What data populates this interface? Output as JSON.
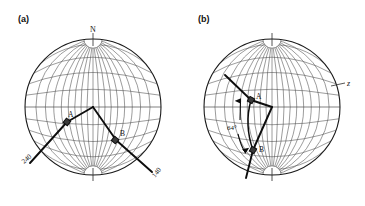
{
  "figure": {
    "type": "stereonet-pair",
    "background": "#ffffff",
    "net_line_color": "#4a4a4a",
    "rim_color": "#1a1a1a",
    "trace_color": "#0d0d0d"
  },
  "panels": [
    {
      "id": "a",
      "label": "(a)",
      "center": {
        "x": 93,
        "y": 107
      },
      "radius": 68,
      "rotation_deg": 0,
      "north_label": "N",
      "axis_labels": [
        {
          "name": "bearing-240",
          "text": "240",
          "x": 24,
          "y": 163,
          "rotation": -40
        },
        {
          "name": "bearing-140",
          "text": "140",
          "x": 157,
          "y": 176,
          "rotation": -52
        }
      ],
      "points": [
        {
          "name": "point-a",
          "label": "A",
          "x": 67,
          "y": 122,
          "label_dx": 1,
          "label_dy": -5
        },
        {
          "name": "point-b",
          "label": "B",
          "x": 116,
          "y": 140,
          "label_dx": 4,
          "label_dy": -4
        }
      ],
      "traces": [
        {
          "name": "trace-240-branch",
          "points": [
            [
              30,
              163
            ],
            [
              67,
              122
            ],
            [
              93,
              107
            ]
          ]
        },
        {
          "name": "trace-140-branch",
          "points": [
            [
              93,
              107
            ],
            [
              116,
              140
            ],
            [
              152,
              172
            ]
          ]
        }
      ]
    },
    {
      "id": "b",
      "label": "(b)",
      "center": {
        "x": 272,
        "y": 107
      },
      "radius": 68,
      "rotation_deg": 0,
      "north_label": "",
      "axis_labels": [
        {
          "name": "axis-z",
          "text": "z",
          "x": 349,
          "y": 83,
          "rotation": 0
        }
      ],
      "points": [
        {
          "name": "point-a",
          "label": "A",
          "x": 251,
          "y": 100,
          "label_dx": 5,
          "label_dy": -3
        },
        {
          "name": "point-b",
          "label": "B",
          "x": 253,
          "y": 150,
          "label_dx": 6,
          "label_dy": 1
        }
      ],
      "angle_annotation": {
        "name": "angle-64",
        "text": "64°",
        "x": 232,
        "y": 128,
        "arrow_top": {
          "x": 241,
          "y": 100
        },
        "arrow_bottom": {
          "x": 245,
          "y": 152
        }
      },
      "traces": [
        {
          "name": "trace-z-branch",
          "points": [
            [
              225,
              75
            ],
            [
              251,
              100
            ],
            [
              272,
              107
            ]
          ]
        },
        {
          "name": "trace-lower-branch",
          "points": [
            [
              272,
              107
            ],
            [
              253,
              150
            ],
            [
              246,
              178
            ]
          ]
        },
        {
          "name": "trace-arc-ab",
          "points": [
            [
              251,
              100
            ],
            [
              246,
              125
            ],
            [
              253,
              150
            ]
          ]
        }
      ]
    }
  ],
  "chart_data": {
    "type": "scatter",
    "title": "",
    "projection": "stereographic (equal-angle Wulff net)",
    "net": {
      "great_circle_interval_deg": 10,
      "small_circle_interval_deg": 10,
      "polar_cap_deg": 10,
      "outline": "full circle primitive"
    },
    "panels": [
      {
        "id": "a",
        "label": "(a)",
        "annotations": [
          "N",
          "240",
          "140",
          "A",
          "B"
        ],
        "description": "Stereonet with N at top; two great-circle traces meeting at centre, one trending toward bearing 240 through point A, the other toward bearing 140 through point B."
      },
      {
        "id": "b",
        "label": "(b)",
        "annotations": [
          "z",
          "A",
          "B",
          "64°"
        ],
        "description": "Rotated stereonet; traces meeting at centre with z axis marked at upper right, points A and B linked by an arc, separation measured as 64 degrees."
      }
    ]
  }
}
